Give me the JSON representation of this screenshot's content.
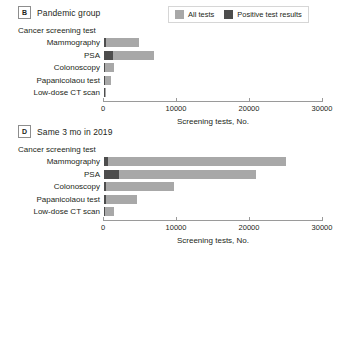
{
  "legend": {
    "items": [
      {
        "label": "All tests",
        "color": "#a8a8a8",
        "name": "legend-all-tests"
      },
      {
        "label": "Positive test results",
        "color": "#4d4d4d",
        "name": "legend-positive-test-results"
      }
    ]
  },
  "panels": [
    {
      "letter": "B",
      "title": "Pandemic group",
      "y_axis_title": "Cancer screening test",
      "x_axis_title": "Screening tests, No."
    },
    {
      "letter": "D",
      "title": "Same 3 mo in 2019",
      "y_axis_title": "Cancer screening test",
      "x_axis_title": "Screening tests, No."
    }
  ],
  "axis": {
    "ticks": [
      "0",
      "10000",
      "20000",
      "30000"
    ],
    "tick_values": [
      0,
      10000,
      20000,
      30000
    ]
  },
  "chart_data": [
    {
      "type": "bar",
      "orientation": "horizontal",
      "title": "Pandemic group",
      "panel": "B",
      "xlabel": "Screening tests, No.",
      "ylabel": "Cancer screening test",
      "xlim": [
        0,
        30000
      ],
      "grid": false,
      "legend_position": "top-right",
      "stacked": true,
      "categories": [
        "Mammography",
        "PSA",
        "Colonoscopy",
        "Papanicolaou test",
        "Low-dose CT scan"
      ],
      "series": [
        {
          "name": "Positive test results",
          "values": [
            300,
            1200,
            150,
            120,
            30
          ]
        },
        {
          "name": "All tests",
          "values": [
            4800,
            6800,
            1400,
            900,
            200
          ]
        }
      ]
    },
    {
      "type": "bar",
      "orientation": "horizontal",
      "title": "Same 3 mo in 2019",
      "panel": "D",
      "xlabel": "Screening tests, No.",
      "ylabel": "Cancer screening test",
      "xlim": [
        0,
        30000
      ],
      "grid": false,
      "legend_position": "none",
      "stacked": true,
      "categories": [
        "Mammography",
        "PSA",
        "Colonoscopy",
        "Papanicolaou test",
        "Low-dose CT scan"
      ],
      "series": [
        {
          "name": "Positive test results",
          "values": [
            600,
            2000,
            250,
            300,
            120
          ]
        },
        {
          "name": "All tests",
          "values": [
            24900,
            20800,
            9600,
            4500,
            1300
          ]
        }
      ]
    }
  ]
}
